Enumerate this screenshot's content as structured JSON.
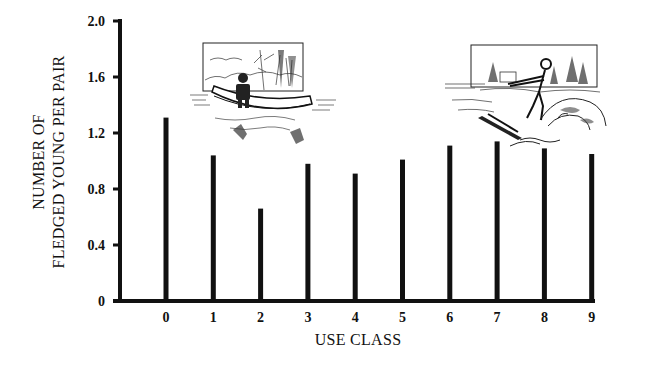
{
  "chart_data": {
    "type": "bar",
    "title": "",
    "xlabel": "USE CLASS",
    "ylabel_lines": [
      "NUMBER OF",
      "FLEDGED YOUNG PER PAIR"
    ],
    "ylabel": "NUMBER OF FLEDGED YOUNG PER PAIR",
    "categories": [
      "0",
      "1",
      "2",
      "3",
      "4",
      "5",
      "6",
      "7",
      "8",
      "9"
    ],
    "values": [
      1.31,
      1.04,
      0.66,
      0.98,
      0.91,
      1.01,
      1.11,
      1.14,
      1.09,
      1.05
    ],
    "ylim": [
      0,
      2.0
    ],
    "yticks": [
      0,
      0.4,
      0.8,
      1.2,
      1.6,
      2.0
    ],
    "ytick_labels": [
      "0",
      "0.4",
      "0.8",
      "1.2",
      "1.6",
      "2.0"
    ],
    "grid": false,
    "legend": null,
    "bar_style": "thin vertical lines",
    "annotations": [
      {
        "type": "illustration",
        "description": "person fishing in a canoe on a lake",
        "position": "above bars 1-3"
      },
      {
        "type": "illustration",
        "description": "water skier on a lake",
        "position": "above bars 7-9"
      }
    ]
  },
  "colors": {
    "ink": "#111111",
    "background": "#ffffff"
  }
}
